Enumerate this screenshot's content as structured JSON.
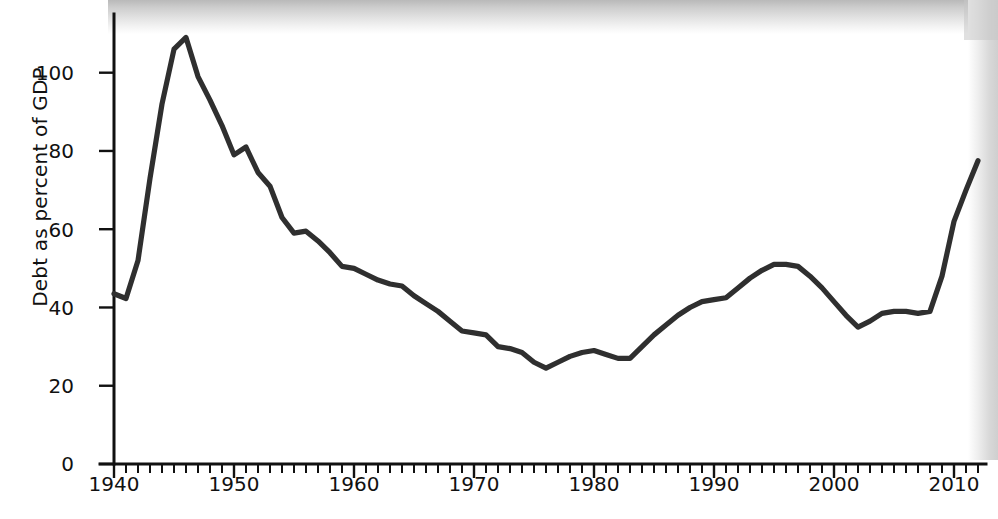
{
  "figure": {
    "ylabel": "Debt as percent of GDP",
    "line_color": "#2f2f2f",
    "axis_color": "#111111",
    "background": "#ffffff"
  },
  "axes": {
    "y_ticks": [
      "0",
      "20",
      "40",
      "60",
      "80",
      "100"
    ],
    "x_ticks": [
      "1940",
      "1950",
      "1960",
      "1970",
      "1980",
      "1990",
      "2000",
      "2010"
    ]
  },
  "chart_data": {
    "type": "line",
    "title": "",
    "subtitle": "",
    "xlabel": "",
    "ylabel": "Debt as percent of GDP",
    "xlim": [
      1940,
      2012
    ],
    "ylim": [
      0,
      115
    ],
    "yticks": [
      0,
      20,
      40,
      60,
      80,
      100
    ],
    "xticks": [
      1940,
      1950,
      1960,
      1970,
      1980,
      1990,
      2000,
      2010
    ],
    "x_minor_tick_step": 1,
    "grid": false,
    "legend": null,
    "annotations": [],
    "series": [
      {
        "name": "Debt as percent of GDP",
        "color": "#2f2f2f",
        "x": [
          1940,
          1941,
          1942,
          1943,
          1944,
          1945,
          1946,
          1947,
          1948,
          1949,
          1950,
          1951,
          1952,
          1953,
          1954,
          1955,
          1956,
          1957,
          1958,
          1959,
          1960,
          1961,
          1962,
          1963,
          1964,
          1965,
          1966,
          1967,
          1968,
          1969,
          1970,
          1971,
          1972,
          1973,
          1974,
          1975,
          1976,
          1977,
          1978,
          1979,
          1980,
          1981,
          1982,
          1983,
          1984,
          1985,
          1986,
          1987,
          1988,
          1989,
          1990,
          1991,
          1992,
          1993,
          1994,
          1995,
          1996,
          1997,
          1998,
          1999,
          2000,
          2001,
          2002,
          2003,
          2004,
          2005,
          2006,
          2007,
          2008,
          2009,
          2010,
          2011,
          2012
        ],
        "values": [
          43.5,
          42.3,
          52.0,
          73.0,
          92.0,
          106.0,
          109.0,
          99.0,
          93.0,
          86.5,
          79.0,
          81.0,
          74.5,
          71.0,
          63.0,
          59.0,
          59.5,
          57.0,
          54.0,
          50.5,
          50.0,
          48.5,
          47.0,
          46.0,
          45.5,
          43.0,
          41.0,
          39.0,
          36.5,
          34.0,
          33.5,
          33.0,
          30.0,
          29.5,
          28.5,
          26.0,
          24.5,
          26.0,
          27.5,
          28.5,
          29.0,
          28.0,
          27.0,
          27.0,
          30.0,
          33.0,
          35.5,
          38.0,
          40.0,
          41.5,
          42.0,
          42.5,
          45.0,
          47.5,
          49.5,
          51.0,
          51.0,
          50.5,
          48.0,
          45.0,
          41.5,
          38.0,
          35.0,
          36.5,
          38.5,
          39.0,
          39.0,
          38.5,
          39.0,
          48.0,
          62.0,
          70.0,
          77.5
        ]
      }
    ]
  }
}
